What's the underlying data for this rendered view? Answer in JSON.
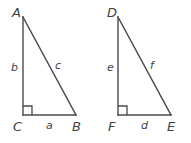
{
  "figure": {
    "type": "geometry-diagram",
    "background_color": "#ffffff",
    "stroke_color": "#4a4a4a",
    "text_color": "#3f3f46",
    "stroke_width": 1.4,
    "triangles": [
      {
        "name": "triangle-abc",
        "vertices": [
          {
            "name": "A",
            "label": "A",
            "x": 23,
            "y": 17,
            "label_x": 12,
            "label_y": 6
          },
          {
            "name": "C",
            "label": "C",
            "x": 23,
            "y": 115,
            "label_x": 13,
            "label_y": 120
          },
          {
            "name": "B",
            "label": "B",
            "x": 76,
            "y": 115,
            "label_x": 72,
            "label_y": 120
          }
        ],
        "sides": [
          {
            "name": "leg-vertical",
            "label": "b",
            "label_x": 11,
            "label_y": 62
          },
          {
            "name": "hypotenuse",
            "label": "c",
            "label_x": 55,
            "label_y": 60
          },
          {
            "name": "leg-horizontal",
            "label": "a",
            "label_x": 46,
            "label_y": 120
          }
        ],
        "right_angle": {
          "vertex": "C",
          "size": 9
        }
      },
      {
        "name": "triangle-def",
        "vertices": [
          {
            "name": "D",
            "label": "D",
            "x": 118,
            "y": 17,
            "label_x": 107,
            "label_y": 6
          },
          {
            "name": "F",
            "label": "F",
            "x": 118,
            "y": 115,
            "label_x": 108,
            "label_y": 120
          },
          {
            "name": "E",
            "label": "E",
            "x": 171,
            "y": 115,
            "label_x": 167,
            "label_y": 120
          }
        ],
        "sides": [
          {
            "name": "leg-vertical",
            "label": "e",
            "label_x": 107,
            "label_y": 62
          },
          {
            "name": "hypotenuse",
            "label": "f",
            "label_x": 150,
            "label_y": 60
          },
          {
            "name": "leg-horizontal",
            "label": "d",
            "label_x": 141,
            "label_y": 120
          }
        ],
        "right_angle": {
          "vertex": "F",
          "size": 9
        }
      }
    ]
  }
}
